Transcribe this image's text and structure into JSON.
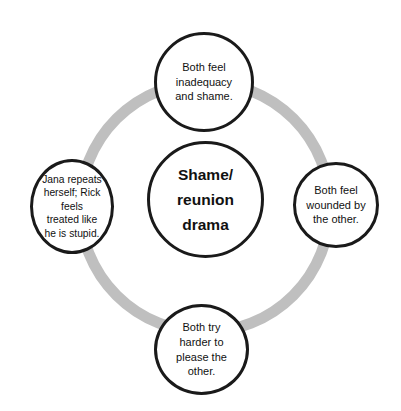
{
  "diagram": {
    "type": "cycle",
    "background_color": "#ffffff",
    "ring": {
      "name": "cycle-ring",
      "color": "#bfbfbf",
      "center_x": 205,
      "center_y": 207,
      "radius": 125,
      "stroke_width": 11
    },
    "center_node": {
      "label": "Shame/\nreunion\ndrama",
      "border_color": "#1a1a1a",
      "fill_color": "#ffffff",
      "text_color": "#111111",
      "bold": true
    },
    "nodes": [
      {
        "position": "top",
        "label": "Both feel\ninadequacy\nand shame.",
        "border_color": "#1a1a1a",
        "fill_color": "#ffffff",
        "text_color": "#111111"
      },
      {
        "position": "right",
        "label": "Both feel\nwounded by\nthe other.",
        "border_color": "#1a1a1a",
        "fill_color": "#ffffff",
        "text_color": "#111111"
      },
      {
        "position": "bottom",
        "label": "Both try\nharder to\nplease the\nother.",
        "border_color": "#1a1a1a",
        "fill_color": "#ffffff",
        "text_color": "#111111"
      },
      {
        "position": "left",
        "label": "Jana repeats\nherself; Rick\nfeels\ntreated like\nhe is stupid.",
        "border_color": "#1a1a1a",
        "fill_color": "#ffffff",
        "text_color": "#111111"
      }
    ]
  }
}
